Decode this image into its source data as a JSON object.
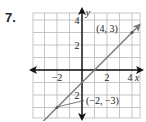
{
  "problem": {
    "number": "7."
  },
  "chart_data": {
    "type": "line",
    "title": "",
    "xlabel": "x",
    "ylabel": "y",
    "xlim": [
      -4,
      4.6
    ],
    "ylim": [
      -3.9,
      4.6
    ],
    "grid": true,
    "x_ticks": [
      {
        "value": -2,
        "label": "−2"
      },
      {
        "value": 2,
        "label": "2"
      },
      {
        "value": 4,
        "label": "4"
      }
    ],
    "y_ticks": [
      {
        "value": 4,
        "label": "4"
      },
      {
        "value": 2,
        "label": "2"
      },
      {
        "value": -2,
        "label": "2"
      }
    ],
    "series": [
      {
        "name": "line",
        "points": [
          {
            "x": -2,
            "y": -3,
            "label": "(−2, −3)"
          },
          {
            "x": 4,
            "y": 3,
            "label": "(4, 3)"
          }
        ],
        "color": "#777777"
      }
    ]
  },
  "colors": {
    "grid": "#b8b8b8",
    "axis": "#111111",
    "line": "#7a7a7a"
  }
}
